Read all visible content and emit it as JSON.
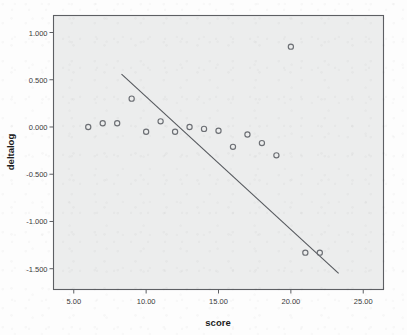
{
  "chart_data": {
    "type": "scatter",
    "title": "",
    "xlabel": "score",
    "ylabel": "deltalog",
    "xlim": [
      3.6,
      26.4
    ],
    "ylim": [
      -1.72,
      1.18
    ],
    "grid": false,
    "legend": null,
    "x_ticks": [
      5,
      10,
      15,
      20,
      25
    ],
    "x_tick_labels": [
      "5.00",
      "10.00",
      "15.00",
      "20.00",
      "25.00"
    ],
    "y_ticks": [
      1.0,
      0.5,
      0.0,
      -0.5,
      -1.0,
      -1.5
    ],
    "y_tick_labels": [
      "1.000",
      "0.500",
      "0.000",
      "-0.500",
      "-1.000",
      "-1.500"
    ],
    "marker": "open-circle",
    "marker_color": "#6c6f74",
    "plot_background": "#eceded",
    "x": [
      6,
      7,
      8,
      9,
      10,
      11,
      12,
      13,
      14,
      15,
      16,
      17,
      18,
      19,
      20,
      21,
      22
    ],
    "y": [
      0.0,
      0.04,
      0.04,
      0.3,
      -0.05,
      0.06,
      -0.05,
      0.0,
      -0.02,
      -0.04,
      -0.21,
      -0.08,
      -0.17,
      -0.3,
      0.85,
      -1.33,
      -1.33
    ],
    "points": [
      {
        "score": 6,
        "deltalog": 0.0
      },
      {
        "score": 7,
        "deltalog": 0.04
      },
      {
        "score": 8,
        "deltalog": 0.04
      },
      {
        "score": 9,
        "deltalog": 0.3
      },
      {
        "score": 10,
        "deltalog": -0.05
      },
      {
        "score": 11,
        "deltalog": 0.06
      },
      {
        "score": 12,
        "deltalog": -0.05
      },
      {
        "score": 13,
        "deltalog": 0.0
      },
      {
        "score": 14,
        "deltalog": -0.02
      },
      {
        "score": 15,
        "deltalog": -0.04
      },
      {
        "score": 16,
        "deltalog": -0.21
      },
      {
        "score": 17,
        "deltalog": -0.08
      },
      {
        "score": 18,
        "deltalog": -0.17
      },
      {
        "score": 19,
        "deltalog": -0.3
      },
      {
        "score": 20,
        "deltalog": 0.85
      },
      {
        "score": 21,
        "deltalog": -1.33
      },
      {
        "score": 22,
        "deltalog": -1.33
      }
    ],
    "fit_line": {
      "type": "linear",
      "x_start": 8.3,
      "y_start": 0.56,
      "x_end": 23.3,
      "y_end": -1.55,
      "color": "#55585d"
    }
  }
}
